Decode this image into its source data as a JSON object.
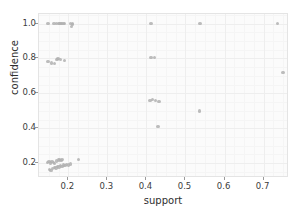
{
  "chart_data": {
    "type": "scatter",
    "title": "",
    "xlabel": "support",
    "ylabel": "confidence",
    "xlim": [
      0.125,
      0.765
    ],
    "ylim": [
      0.115,
      1.055
    ],
    "xticks": [
      0.2,
      0.3,
      0.4,
      0.5,
      0.6,
      0.7
    ],
    "xticklabels": [
      "0.2",
      "0.3",
      "0.4",
      "0.5",
      "0.6",
      "0.7"
    ],
    "yticks": [
      0.2,
      0.4,
      0.6,
      0.8,
      1.0
    ],
    "yticklabels": [
      "0.2",
      "0.4",
      "0.6",
      "0.8",
      "1.0"
    ],
    "grid": true,
    "legend": null,
    "marker_color": "#b0b0b0",
    "background_color": "#fbfbfb",
    "grid_color": "#eeeeee",
    "points": [
      {
        "x": 0.148,
        "y": 1.0
      },
      {
        "x": 0.163,
        "y": 1.0
      },
      {
        "x": 0.17,
        "y": 1.0
      },
      {
        "x": 0.176,
        "y": 1.0
      },
      {
        "x": 0.179,
        "y": 1.0
      },
      {
        "x": 0.182,
        "y": 1.0
      },
      {
        "x": 0.186,
        "y": 1.0
      },
      {
        "x": 0.19,
        "y": 1.0
      },
      {
        "x": 0.206,
        "y": 1.0
      },
      {
        "x": 0.21,
        "y": 1.0
      },
      {
        "x": 0.211,
        "y": 0.995
      },
      {
        "x": 0.208,
        "y": 0.985
      },
      {
        "x": 0.412,
        "y": 1.0
      },
      {
        "x": 0.537,
        "y": 1.0
      },
      {
        "x": 0.735,
        "y": 1.0
      },
      {
        "x": 0.148,
        "y": 0.782
      },
      {
        "x": 0.157,
        "y": 0.775
      },
      {
        "x": 0.165,
        "y": 0.772
      },
      {
        "x": 0.171,
        "y": 0.795
      },
      {
        "x": 0.174,
        "y": 0.8
      },
      {
        "x": 0.18,
        "y": 0.793
      },
      {
        "x": 0.19,
        "y": 0.79
      },
      {
        "x": 0.412,
        "y": 0.805
      },
      {
        "x": 0.421,
        "y": 0.805
      },
      {
        "x": 0.75,
        "y": 0.72
      },
      {
        "x": 0.409,
        "y": 0.56
      },
      {
        "x": 0.416,
        "y": 0.565
      },
      {
        "x": 0.423,
        "y": 0.558
      },
      {
        "x": 0.432,
        "y": 0.555
      },
      {
        "x": 0.536,
        "y": 0.5
      },
      {
        "x": 0.43,
        "y": 0.41
      },
      {
        "x": 0.146,
        "y": 0.205
      },
      {
        "x": 0.151,
        "y": 0.208
      },
      {
        "x": 0.155,
        "y": 0.2
      },
      {
        "x": 0.158,
        "y": 0.21
      },
      {
        "x": 0.162,
        "y": 0.203
      },
      {
        "x": 0.165,
        "y": 0.198
      },
      {
        "x": 0.17,
        "y": 0.212
      },
      {
        "x": 0.175,
        "y": 0.218
      },
      {
        "x": 0.178,
        "y": 0.222
      },
      {
        "x": 0.181,
        "y": 0.215
      },
      {
        "x": 0.184,
        "y": 0.22
      },
      {
        "x": 0.152,
        "y": 0.165
      },
      {
        "x": 0.156,
        "y": 0.158
      },
      {
        "x": 0.16,
        "y": 0.17
      },
      {
        "x": 0.164,
        "y": 0.175
      },
      {
        "x": 0.168,
        "y": 0.172
      },
      {
        "x": 0.172,
        "y": 0.18
      },
      {
        "x": 0.176,
        "y": 0.178
      },
      {
        "x": 0.18,
        "y": 0.185
      },
      {
        "x": 0.184,
        "y": 0.182
      },
      {
        "x": 0.188,
        "y": 0.19
      },
      {
        "x": 0.192,
        "y": 0.188
      },
      {
        "x": 0.196,
        "y": 0.193
      },
      {
        "x": 0.2,
        "y": 0.19
      },
      {
        "x": 0.205,
        "y": 0.196
      },
      {
        "x": 0.226,
        "y": 0.222
      }
    ]
  }
}
